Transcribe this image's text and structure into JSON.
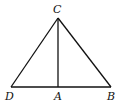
{
  "diagram": {
    "type": "geometry",
    "points": {
      "C": {
        "label": "C",
        "x": 58,
        "y": 18
      },
      "D": {
        "label": "D",
        "x": 11,
        "y": 87
      },
      "A": {
        "label": "A",
        "x": 58,
        "y": 87
      },
      "B": {
        "label": "B",
        "x": 111,
        "y": 87
      }
    },
    "segments": [
      {
        "from": "C",
        "to": "D"
      },
      {
        "from": "C",
        "to": "B"
      },
      {
        "from": "D",
        "to": "B"
      },
      {
        "from": "C",
        "to": "A"
      }
    ],
    "labels": {
      "C": {
        "text": "C",
        "x": 53,
        "y": 13
      },
      "D": {
        "text": "D",
        "x": 5,
        "y": 100
      },
      "A": {
        "text": "A",
        "x": 54,
        "y": 100
      },
      "B": {
        "text": "B",
        "x": 107,
        "y": 100
      }
    },
    "colors": {
      "stroke": "#111111",
      "background": "#ffffff"
    }
  }
}
